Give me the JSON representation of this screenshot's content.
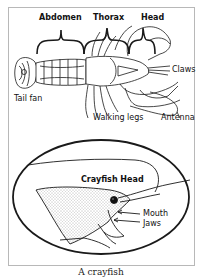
{
  "figure": {
    "caption": "A crayfish",
    "top_diagram": {
      "segment_labels": [
        "Abdomen",
        "Thorax",
        "Head"
      ],
      "part_labels": {
        "tail_fan": "Tail fan",
        "claws": "Claws",
        "walking_legs": "Walking legs",
        "antenna": "Antenna"
      }
    },
    "inset": {
      "title": "Crayfish Head",
      "labels": {
        "mouth": "Mouth",
        "jaws": "Jaws"
      }
    }
  },
  "colors": {
    "line": "#1a1a1a",
    "frame": "#b8b8b8",
    "stipple": "#555555",
    "background": "#ffffff"
  }
}
